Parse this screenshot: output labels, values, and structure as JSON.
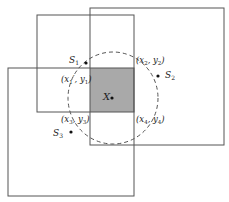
{
  "diagram": {
    "colors": {
      "stroke": "#555555",
      "shade": "#a9a9a9",
      "point": "#111111",
      "text": "#222222"
    },
    "rects": [
      {
        "name": "rect-top-left",
        "x": 37,
        "y": 15,
        "w": 97,
        "h": 97
      },
      {
        "name": "rect-top-right",
        "x": 90,
        "y": 8,
        "w": 134,
        "h": 137
      },
      {
        "name": "rect-bottom-left",
        "x": 8,
        "y": 68,
        "w": 126,
        "h": 128
      }
    ],
    "overlap": {
      "x": 90,
      "y": 68,
      "w": 44,
      "h": 44
    },
    "circle": {
      "cx": 113,
      "cy": 98,
      "rx": 45,
      "ry": 46
    },
    "points": {
      "X": {
        "label": "X",
        "x": 112,
        "y": 98
      },
      "S1": {
        "label": "S",
        "sub": "1",
        "x": 86,
        "y": 63
      },
      "S2": {
        "label": "S",
        "sub": "2",
        "x": 158,
        "y": 76
      },
      "S3": {
        "label": "S",
        "sub": "3",
        "x": 71,
        "y": 132
      }
    },
    "corner_labels": {
      "c1": {
        "text": "(x1', y1)",
        "x_sub": "1",
        "y_sub": "1"
      },
      "c2": {
        "text": "(x2, y2)",
        "x_sub": "2",
        "y_sub": "2"
      },
      "c3": {
        "text": "(x3, y3)",
        "x_sub": "3",
        "y_sub": "3"
      },
      "c4": {
        "text": "(x4, y4)",
        "x_sub": "4",
        "y_sub": "4"
      }
    }
  }
}
